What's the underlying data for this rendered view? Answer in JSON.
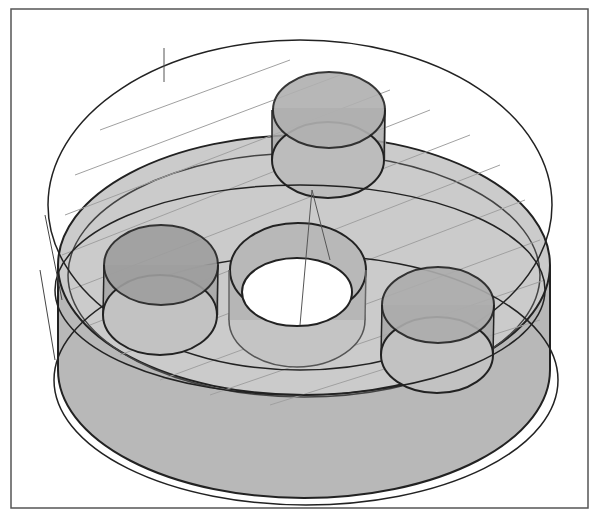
{
  "diagram": {
    "type": "cad-3d-toolpath-view",
    "colors": {
      "frame": "#555555",
      "outline": "#222222",
      "part_fill": "#c8c8c8",
      "part_side": "#b4b4b4",
      "boss_fill": "#a8a8a8",
      "toolpath": "#9a9a9a",
      "background": "#ffffff"
    },
    "elements": [
      {
        "name": "outer-boundary-loop",
        "kind": "toolpath-outline"
      },
      {
        "name": "zigzag-toolpath",
        "kind": "toolpath-raster"
      },
      {
        "name": "base-disc",
        "kind": "solid"
      },
      {
        "name": "boss-top",
        "kind": "cylinder"
      },
      {
        "name": "boss-left",
        "kind": "cylinder"
      },
      {
        "name": "hole-center",
        "kind": "cylindrical-hole"
      },
      {
        "name": "boss-right",
        "kind": "cylinder"
      }
    ]
  }
}
